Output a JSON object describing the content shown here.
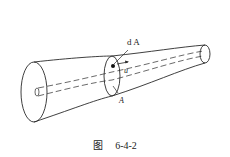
{
  "figure": {
    "labels": {
      "area_element": "d A",
      "velocity": "u",
      "cross_section": "A"
    },
    "caption": {
      "prefix": "图",
      "number": "6-4-2"
    },
    "colors": {
      "stroke": "#2a2a2a",
      "background": "#ffffff",
      "text": "#222222"
    }
  }
}
